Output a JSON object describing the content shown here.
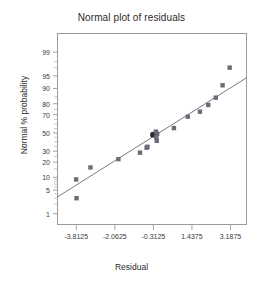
{
  "chart_data": {
    "type": "scatter",
    "title": "Normal plot of residuals",
    "xlabel": "Residual",
    "ylabel": "Normal % probability",
    "grid": false,
    "legend": null,
    "xlim": [
      -4.6875,
      3.9375
    ],
    "xticks": [
      -3.8125,
      -2.0625,
      -0.3125,
      1.4375,
      3.1875
    ],
    "xticklabels": [
      "-3.8125",
      "-2.0625",
      "-0.3125",
      "1.4375",
      "3.1875"
    ],
    "yscale": "normal-probability",
    "ylim": [
      0.4,
      99.8
    ],
    "yticks": [
      1,
      5,
      10,
      20,
      30,
      50,
      70,
      80,
      90,
      95,
      99
    ],
    "yticklabels": [
      "1",
      "5",
      "10",
      "20",
      "30",
      "50",
      "70",
      "80",
      "90",
      "95",
      "99"
    ],
    "points": [
      {
        "x": -3.8,
        "y": 3.0,
        "highlighted": false
      },
      {
        "x": -3.82,
        "y": 9.0,
        "highlighted": false
      },
      {
        "x": -3.17,
        "y": 16.0,
        "highlighted": false
      },
      {
        "x": -1.9,
        "y": 22.5,
        "highlighted": false
      },
      {
        "x": -0.92,
        "y": 28.5,
        "highlighted": false
      },
      {
        "x": -0.62,
        "y": 33.5,
        "highlighted": false
      },
      {
        "x": -0.58,
        "y": 34.5,
        "highlighted": false
      },
      {
        "x": -0.33,
        "y": 48.0,
        "highlighted": true
      },
      {
        "x": -0.2,
        "y": 51.5,
        "highlighted": false
      },
      {
        "x": -0.18,
        "y": 45.0,
        "highlighted": false
      },
      {
        "x": -0.16,
        "y": 41.0,
        "highlighted": false
      },
      {
        "x": -0.14,
        "y": 49.0,
        "highlighted": false
      },
      {
        "x": 0.62,
        "y": 55.5,
        "highlighted": false
      },
      {
        "x": 1.25,
        "y": 68.0,
        "highlighted": false
      },
      {
        "x": 1.8,
        "y": 73.0,
        "highlighted": false
      },
      {
        "x": 2.18,
        "y": 79.0,
        "highlighted": false
      },
      {
        "x": 2.52,
        "y": 84.5,
        "highlighted": false
      },
      {
        "x": 2.83,
        "y": 91.5,
        "highlighted": false
      },
      {
        "x": 3.15,
        "y": 97.0,
        "highlighted": false
      }
    ],
    "reference_line": {
      "label": "normal reference line",
      "x_start": -4.6875,
      "y_start": 3.2,
      "x_end": 3.9375,
      "y_end": 94.5
    },
    "marker_color": "#6b6b78",
    "marker_highlight_color": "#2a2a33",
    "line_color": "#6a6a72",
    "frame_color": "#9a9a9a"
  }
}
